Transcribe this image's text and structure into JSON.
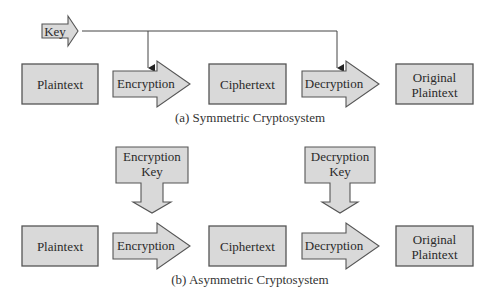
{
  "symmetric": {
    "key_label": "Key",
    "plaintext": "Plaintext",
    "encryption": "Encryption",
    "ciphertext": "Ciphertext",
    "decryption": "Decryption",
    "original_line1": "Original",
    "original_line2": "Plaintext",
    "caption": "(a) Symmetric Cryptosystem"
  },
  "asymmetric": {
    "enc_key_line1": "Encryption",
    "enc_key_line2": "Key",
    "dec_key_line1": "Decryption",
    "dec_key_line2": "Key",
    "plaintext": "Plaintext",
    "encryption": "Encryption",
    "ciphertext": "Ciphertext",
    "decryption": "Decryption",
    "original_line1": "Original",
    "original_line2": "Plaintext",
    "caption": "(b) Asymmetric Cryptosystem"
  }
}
